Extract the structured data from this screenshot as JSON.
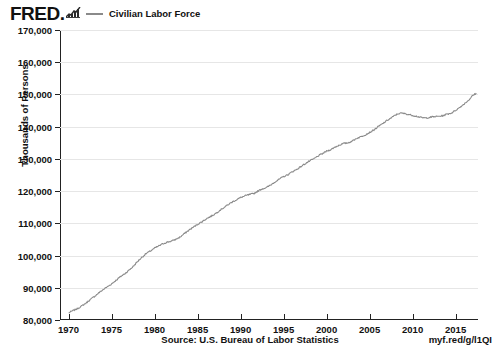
{
  "brand": {
    "logo_text": "FRED.",
    "logo_icon": "sparkline-icon"
  },
  "legend": {
    "entries": [
      {
        "label": "Civilian Labor Force",
        "color": "#8a8a8a"
      }
    ]
  },
  "footer": {
    "source": "Source: U.S. Bureau of Labor Statistics",
    "short_url": "myf.red/g/l1QI"
  },
  "chart_data": {
    "type": "line",
    "title": "",
    "xlabel": "",
    "ylabel": "Thousands of Persons",
    "grid": true,
    "legend_position": "top-left",
    "xlim": [
      1969.0,
      2017.6
    ],
    "ylim": [
      80000,
      170000
    ],
    "ytick_labels": [
      "170,000",
      "160,000",
      "150,000",
      "140,000",
      "130,000",
      "120,000",
      "110,000",
      "100,000",
      "90,000",
      "80,000"
    ],
    "ytick_values": [
      170000,
      160000,
      150000,
      140000,
      130000,
      120000,
      110000,
      100000,
      90000,
      80000
    ],
    "xtick_labels": [
      "1970",
      "1975",
      "1980",
      "1985",
      "1990",
      "1995",
      "2000",
      "2005",
      "2010",
      "2015"
    ],
    "xtick_values": [
      1970,
      1975,
      1980,
      1985,
      1990,
      1995,
      2000,
      2005,
      2010,
      2015
    ],
    "series": [
      {
        "name": "Civilian Labor Force",
        "color": "#8a8a8a",
        "x": [
          1970.0,
          1970.5,
          1971.0,
          1971.5,
          1972.0,
          1972.5,
          1973.0,
          1973.5,
          1974.0,
          1974.5,
          1975.0,
          1975.5,
          1976.0,
          1976.5,
          1977.0,
          1977.5,
          1978.0,
          1978.5,
          1979.0,
          1979.5,
          1980.0,
          1980.5,
          1981.0,
          1981.5,
          1982.0,
          1982.5,
          1983.0,
          1983.5,
          1984.0,
          1984.5,
          1985.0,
          1985.5,
          1986.0,
          1986.5,
          1987.0,
          1987.5,
          1988.0,
          1988.5,
          1989.0,
          1989.5,
          1990.0,
          1990.5,
          1991.0,
          1991.5,
          1992.0,
          1992.5,
          1993.0,
          1993.5,
          1994.0,
          1994.5,
          1995.0,
          1995.5,
          1996.0,
          1996.5,
          1997.0,
          1997.5,
          1998.0,
          1998.5,
          1999.0,
          1999.5,
          2000.0,
          2000.5,
          2001.0,
          2001.5,
          2002.0,
          2002.5,
          2003.0,
          2003.5,
          2004.0,
          2004.5,
          2005.0,
          2005.5,
          2006.0,
          2006.5,
          2007.0,
          2007.5,
          2008.0,
          2008.5,
          2009.0,
          2009.5,
          2010.0,
          2010.5,
          2011.0,
          2011.5,
          2012.0,
          2012.5,
          2013.0,
          2013.5,
          2014.0,
          2014.5,
          2015.0,
          2015.5,
          2016.0,
          2016.5,
          2017.0,
          2017.4
        ],
        "y": [
          82200,
          82900,
          83500,
          84300,
          85200,
          86300,
          87300,
          88400,
          89400,
          90300,
          91200,
          92300,
          93400,
          94300,
          95400,
          96600,
          98100,
          99400,
          100600,
          101400,
          102300,
          103000,
          103700,
          104200,
          104500,
          105100,
          105800,
          106900,
          107900,
          108800,
          109700,
          110500,
          111400,
          112100,
          112900,
          113900,
          114800,
          115700,
          116600,
          117300,
          118000,
          118500,
          118900,
          119200,
          120000,
          120700,
          121100,
          121900,
          122900,
          123700,
          124500,
          125100,
          126000,
          126700,
          127600,
          128500,
          129300,
          130000,
          130900,
          131600,
          132400,
          132900,
          133700,
          134300,
          134800,
          135000,
          135600,
          136400,
          136900,
          137500,
          138200,
          139000,
          140000,
          140900,
          141900,
          142700,
          143600,
          144200,
          144100,
          143800,
          143500,
          143200,
          142800,
          142700,
          142900,
          143100,
          143200,
          143400,
          143900,
          144200,
          145100,
          146000,
          147100,
          148200,
          149700,
          150400
        ]
      }
    ],
    "annotations": {
      "start_value": 82200,
      "end_value": 161000,
      "peak_pre_recession": 154500
    }
  }
}
